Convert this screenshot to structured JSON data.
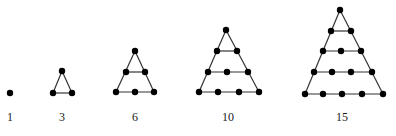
{
  "diagram": {
    "figures": [
      {
        "label": "1",
        "label_pos": [
          10,
          121
        ],
        "rows": [
          [
            [
              10,
              93
            ]
          ]
        ]
      },
      {
        "label": "3",
        "label_pos": [
          62,
          121
        ],
        "rows": [
          [
            [
              62,
              71
            ]
          ],
          [
            [
              53,
              93
            ],
            [
              72,
              93
            ]
          ]
        ]
      },
      {
        "label": "6",
        "label_pos": [
          135,
          121
        ],
        "rows": [
          [
            [
              135,
              51
            ]
          ],
          [
            [
              126,
              72
            ],
            [
              145,
              72
            ]
          ],
          [
            [
              116,
              92
            ],
            [
              135,
              92
            ],
            [
              154,
              92
            ]
          ]
        ]
      },
      {
        "label": "10",
        "label_pos": [
          228,
          121
        ],
        "rows": [
          [
            [
              226,
              30
            ]
          ],
          [
            [
              217,
              51
            ],
            [
              237,
              51
            ]
          ],
          [
            [
              208,
              72
            ],
            [
              227,
              72
            ],
            [
              248,
              72
            ]
          ],
          [
            [
              199,
              92
            ],
            [
              218,
              92
            ],
            [
              239,
              92
            ],
            [
              259,
              92
            ]
          ]
        ]
      },
      {
        "label": "15",
        "label_pos": [
          342,
          121
        ],
        "rows": [
          [
            [
              340,
              10
            ]
          ],
          [
            [
              331,
              31
            ],
            [
              351,
              31
            ]
          ],
          [
            [
              323,
              51
            ],
            [
              341,
              51
            ],
            [
              361,
              51
            ]
          ],
          [
            [
              314,
              72
            ],
            [
              332,
              72
            ],
            [
              351,
              72
            ],
            [
              372,
              72
            ]
          ],
          [
            [
              305,
              94
            ],
            [
              323,
              94
            ],
            [
              342,
              94
            ],
            [
              362,
              94
            ],
            [
              383,
              94
            ]
          ]
        ]
      }
    ]
  }
}
